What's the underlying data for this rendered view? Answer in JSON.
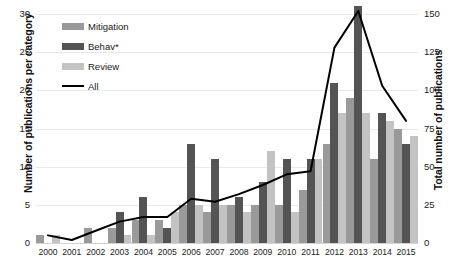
{
  "chart_data": {
    "type": "bar",
    "title": "",
    "xlabel": "",
    "ylabel": "Number of publications per category",
    "y2label": "Total number of publications",
    "grid": true,
    "legend_position": "top-left",
    "categories": [
      "2000",
      "2001",
      "2002",
      "2003",
      "2004",
      "2005",
      "2006",
      "2007",
      "2008",
      "2009",
      "2010",
      "2011",
      "2012",
      "2013",
      "2014",
      "2015"
    ],
    "ylim": [
      0,
      30
    ],
    "yticks": [
      0,
      5,
      10,
      15,
      20,
      25,
      30
    ],
    "y2lim": [
      0,
      150
    ],
    "y2ticks": [
      0,
      25,
      50,
      75,
      100,
      125,
      150
    ],
    "series": [
      {
        "name": "Mitigation",
        "axis": "left",
        "color": "#9a9a9a",
        "values": [
          1,
          0,
          2,
          2,
          3,
          3,
          5,
          4,
          5,
          5,
          5,
          7,
          13,
          19,
          11,
          15
        ]
      },
      {
        "name": "Behav*",
        "axis": "left",
        "color": "#545454",
        "values": [
          0,
          0,
          0,
          4,
          6,
          2,
          13,
          11,
          6,
          8,
          11,
          11,
          21,
          31,
          17,
          13
        ]
      },
      {
        "name": "Review",
        "axis": "left",
        "color": "#c3c3c3",
        "values": [
          1,
          0,
          0,
          1,
          1,
          4,
          5,
          5,
          4,
          12,
          4,
          11,
          17,
          17,
          16,
          14
        ]
      },
      {
        "name": "All",
        "axis": "right",
        "color": "#000000",
        "type": "line",
        "values": [
          5,
          2,
          8,
          14,
          17,
          17,
          29,
          27,
          32,
          38,
          45,
          47,
          128,
          152,
          103,
          80
        ]
      }
    ]
  },
  "legend": {
    "items": [
      {
        "label": "Mitigation",
        "swatch": "mitigation"
      },
      {
        "label": "Behav*",
        "swatch": "behav"
      },
      {
        "label": "Review",
        "swatch": "review"
      },
      {
        "label": "All",
        "swatch": "line"
      }
    ]
  }
}
